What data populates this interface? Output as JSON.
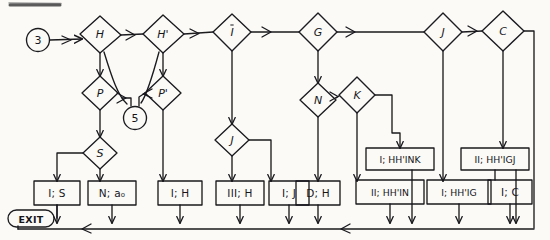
{
  "diagram": {
    "kind": "flowchart",
    "ink_color": "#1a1a1e",
    "paper_color": "#fbfaf7"
  },
  "start_nodes": [
    {
      "name": "start-3",
      "label": "3",
      "shape": "circle",
      "x": 38,
      "y": 40,
      "r": 11
    },
    {
      "name": "connector-5",
      "label": "5",
      "shape": "circle",
      "x": 135,
      "y": 118,
      "r": 11
    }
  ],
  "decisions": [
    {
      "name": "decision-H",
      "label": "H",
      "x": 100,
      "y": 33
    },
    {
      "name": "decision-Hprime",
      "label": "H'",
      "x": 163,
      "y": 33
    },
    {
      "name": "decision-I",
      "label": "I",
      "x": 232,
      "y": 32
    },
    {
      "name": "decision-G",
      "label": "G",
      "x": 318,
      "y": 32
    },
    {
      "name": "decision-J-top",
      "label": "J",
      "x": 443,
      "y": 32
    },
    {
      "name": "decision-C",
      "label": "C",
      "x": 503,
      "y": 31
    },
    {
      "name": "decision-P",
      "label": "P",
      "x": 100,
      "y": 93
    },
    {
      "name": "decision-Pprime",
      "label": "P'",
      "x": 163,
      "y": 93
    },
    {
      "name": "decision-N",
      "label": "N",
      "x": 318,
      "y": 100
    },
    {
      "name": "decision-K",
      "label": "K",
      "x": 357,
      "y": 95
    },
    {
      "name": "decision-S",
      "label": "S",
      "x": 100,
      "y": 153
    },
    {
      "name": "decision-J-mid",
      "label": "J",
      "x": 232,
      "y": 140
    }
  ],
  "boxes": [
    {
      "name": "box-I-S",
      "label": "I; S",
      "style": "normal",
      "x": 57,
      "y": 193,
      "w": 46,
      "h": 24
    },
    {
      "name": "box-N-a0",
      "label": "N; a₀",
      "style": "normal",
      "x": 112,
      "y": 193,
      "w": 48,
      "h": 24
    },
    {
      "name": "box-I-H",
      "label": "I; H",
      "style": "normal",
      "x": 180,
      "y": 193,
      "w": 44,
      "h": 24
    },
    {
      "name": "box-III-H",
      "label": "III; H",
      "style": "normal",
      "x": 240,
      "y": 193,
      "w": 48,
      "h": 24
    },
    {
      "name": "box-I-J",
      "label": "I; J",
      "style": "normal",
      "x": 289,
      "y": 193,
      "w": 40,
      "h": 24
    },
    {
      "name": "box-D-H",
      "label": "D; H",
      "style": "normal",
      "x": 334,
      "y": 193,
      "w": 44,
      "h": 24
    },
    {
      "name": "box-I-HHpIN",
      "label": "I; HH'INK",
      "style": "upper",
      "x": 400,
      "y": 159,
      "w": 68,
      "h": 22
    },
    {
      "name": "box-II-HHpIN",
      "label": "II; HH'IN",
      "style": "normal",
      "x": 390,
      "y": 192,
      "w": 68,
      "h": 24
    },
    {
      "name": "box-I-HHpIG",
      "label": "I; HH'IG",
      "style": "normal",
      "x": 459,
      "y": 192,
      "w": 64,
      "h": 24
    },
    {
      "name": "box-II-HHpIGJ",
      "label": "II; HH'IGJ",
      "style": "upper",
      "x": 495,
      "y": 159,
      "w": 68,
      "h": 22
    },
    {
      "name": "box-I-C",
      "label": "I; C",
      "style": "normal",
      "x": 510,
      "y": 192,
      "w": 44,
      "h": 24
    }
  ],
  "terminals": [
    {
      "name": "exit-terminal",
      "label": "EXIT",
      "x": 30,
      "y": 218,
      "w": 46,
      "h": 16
    }
  ],
  "bus": {
    "name": "return-bus",
    "label": "bottom return bus",
    "y": 229,
    "x_start": 18,
    "x_end": 534
  },
  "edge_labels": [],
  "legend": []
}
